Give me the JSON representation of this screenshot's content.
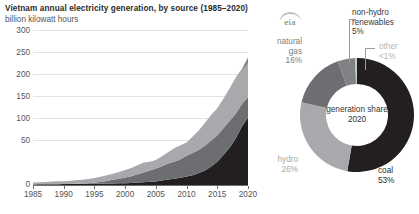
{
  "header": {
    "title": "Vietnam annual electricity generation, by source (1985–2020)",
    "subtitle": "billion kilowatt hours",
    "logo_text": "eia",
    "logo_icon": "eia-logo-icon"
  },
  "chart_data": [
    {
      "type": "area",
      "id": "stacked-area",
      "title": "Vietnam annual electricity generation, by source (1985–2020)",
      "xlabel": "",
      "ylabel": "billion kilowatt hours",
      "ylim": [
        0,
        300
      ],
      "xlim": [
        1985,
        2020
      ],
      "grid": true,
      "ytick_labels": [
        "300",
        "250",
        "200",
        "150",
        "100",
        "50",
        "0"
      ],
      "ytick_values": [
        300,
        250,
        200,
        150,
        100,
        50,
        0
      ],
      "xtick_labels": [
        "1985",
        "1990",
        "1995",
        "2000",
        "2005",
        "2010",
        "2015",
        "2020"
      ],
      "xtick_values": [
        1985,
        1990,
        1995,
        2000,
        2005,
        2010,
        2015,
        2020
      ],
      "x": [
        1985,
        1986,
        1987,
        1988,
        1989,
        1990,
        1991,
        1992,
        1993,
        1994,
        1995,
        1996,
        1997,
        1998,
        1999,
        2000,
        2001,
        2002,
        2003,
        2004,
        2005,
        2006,
        2007,
        2008,
        2009,
        2010,
        2011,
        2012,
        2013,
        2014,
        2015,
        2016,
        2017,
        2018,
        2019,
        2020
      ],
      "stack_order": [
        "coal",
        "natural gas",
        "hydro",
        "non-hydro renewables",
        "other"
      ],
      "series": [
        {
          "name": "coal",
          "color": "#231f20",
          "values": [
            1.2,
            1.3,
            1.4,
            1.5,
            1.6,
            1.7,
            1.8,
            1.9,
            2.0,
            2.2,
            2.4,
            2.6,
            2.8,
            3.0,
            3.3,
            3.6,
            4.0,
            4.6,
            5.4,
            6.2,
            7.0,
            8.5,
            10.5,
            12.0,
            14.0,
            16.5,
            19.0,
            23.0,
            28.0,
            36.0,
            45.0,
            58.0,
            72.0,
            90.0,
            113.0,
            130.0
          ]
        },
        {
          "name": "natural gas",
          "color": "#6d6e71",
          "values": [
            0,
            0,
            0,
            0,
            0,
            0,
            0.2,
            0.4,
            0.8,
            1.4,
            2.2,
            3.4,
            5.0,
            7.0,
            9.0,
            11.0,
            13.0,
            16.0,
            19.0,
            22.0,
            25.0,
            28.0,
            31.0,
            33.0,
            36.0,
            40.0,
            43.0,
            45.0,
            48.0,
            50.0,
            51.0,
            52.0,
            52.0,
            48.0,
            44.0,
            40.0
          ]
        },
        {
          "name": "hydro",
          "color": "#a7a9ac",
          "values": [
            3.5,
            4.0,
            4.6,
            5.2,
            5.8,
            5.4,
            6.2,
            6.8,
            7.2,
            8.0,
            9.0,
            10.0,
            11.0,
            12.0,
            13.0,
            14.5,
            16.0,
            17.5,
            19.0,
            17.0,
            16.5,
            19.0,
            22.0,
            26.0,
            27.0,
            26.0,
            32.0,
            38.0,
            44.0,
            49.0,
            52.0,
            56.0,
            62.0,
            68.0,
            64.0,
            65.0
          ]
        },
        {
          "name": "non-hydro renewables",
          "color": "#808285",
          "values": [
            0,
            0,
            0,
            0,
            0,
            0,
            0,
            0,
            0,
            0,
            0,
            0,
            0,
            0,
            0,
            0,
            0,
            0,
            0,
            0,
            0,
            0,
            0,
            0,
            0,
            0,
            0.1,
            0.2,
            0.3,
            0.4,
            0.5,
            0.7,
            1.0,
            1.5,
            3.0,
            12.0
          ]
        },
        {
          "name": "other",
          "color": "#c7c8ca",
          "values": [
            0,
            0,
            0,
            0,
            0,
            0,
            0,
            0,
            0,
            0,
            0,
            0,
            0,
            0,
            0,
            0,
            0,
            0,
            0,
            0,
            0,
            0,
            0,
            0,
            0,
            0,
            0,
            0,
            0,
            0,
            0,
            0,
            0,
            0,
            0.3,
            0.5
          ]
        }
      ],
      "annotations": [
        {
          "id": "gas-label",
          "lines": [
            "natural",
            "gas",
            "16%"
          ],
          "color": "#7d7d7d"
        },
        {
          "id": "hydro-label",
          "lines": [
            "hydro",
            "26%"
          ],
          "color": "#a8a8a8"
        }
      ]
    },
    {
      "type": "pie",
      "id": "generation-share-donut",
      "title": "generation share",
      "subtitle": "2020",
      "center_line1": "generation share",
      "center_line2": "2020",
      "labels": [
        "coal",
        "hydro",
        "natural gas",
        "non-hydro renewables",
        "other"
      ],
      "values": [
        53,
        26,
        16,
        5,
        0.5
      ],
      "value_labels": [
        "53%",
        "26%",
        "16%",
        "5%",
        "<1%"
      ],
      "colors": [
        "#231f20",
        "#a7a9ac",
        "#6d6e71",
        "#808285",
        "#c7c8ca"
      ],
      "callouts": [
        {
          "id": "renewables",
          "line1": "non-hydro",
          "line2": "renewables",
          "line3": "5%"
        },
        {
          "id": "other",
          "line1": "other",
          "line2": "<1%"
        },
        {
          "id": "coal",
          "line1": "coal",
          "line2": "53%"
        }
      ]
    }
  ],
  "axis": {
    "y_labels": [
      "300",
      "250",
      "200",
      "150",
      "100",
      "50",
      "0"
    ],
    "x_labels": [
      "1985",
      "1990",
      "1995",
      "2000",
      "2005",
      "2010",
      "2015",
      "2020"
    ]
  },
  "area_labels": {
    "gas_l1": "natural",
    "gas_l2": "gas",
    "gas_l3": "16%",
    "hydro_l1": "hydro",
    "hydro_l2": "26%"
  },
  "donut": {
    "center_l1": "generation share",
    "center_l2": "2020",
    "renew_l1": "non-hydro",
    "renew_l2": "renewables",
    "renew_l3": "5%",
    "other_l1": "other",
    "other_l2": "<1%",
    "coal_l1": "coal",
    "coal_l2": "53%"
  }
}
